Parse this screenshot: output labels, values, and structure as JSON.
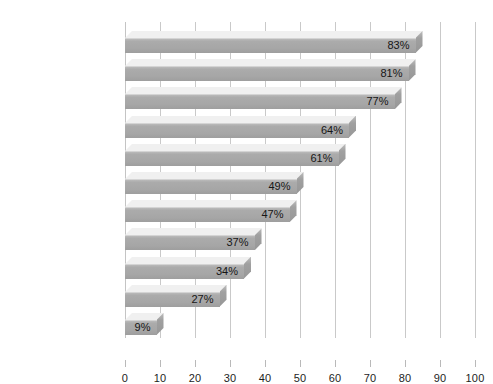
{
  "chart_data": {
    "type": "bar",
    "orientation": "horizontal",
    "title": "",
    "subtitle": "",
    "xlabel": "",
    "ylabel": "",
    "xlim": [
      0,
      100
    ],
    "xtick_step": 10,
    "grid": true,
    "legend": null,
    "value_suffix": "%",
    "categories": [
      "Television",
      "Stereo",
      "Computer",
      "Video game system",
      "DVD player",
      "CD burner",
      "Cell phone",
      "Auto",
      "In-line skates",
      "Digital camera",
      "Pager/beeper"
    ],
    "values": [
      83,
      81,
      77,
      64,
      61,
      49,
      47,
      37,
      34,
      27,
      9
    ],
    "value_labels": [
      "83%",
      "81%",
      "77%",
      "64%",
      "61%",
      "49%",
      "47%",
      "37%",
      "34%",
      "27%",
      "9%"
    ],
    "xticks": [
      0,
      10,
      20,
      30,
      40,
      50,
      60,
      70,
      80,
      90,
      100
    ],
    "xtick_labels": [
      "0",
      "10",
      "20",
      "30",
      "40",
      "50",
      "60",
      "70",
      "80",
      "90",
      "100"
    ],
    "colors": {
      "background": "#ffffff",
      "bar_front": "#a9a9a9",
      "bar_top": "#f0f0f0",
      "bar_cap": "#9a9a9a",
      "gridline": "#c9c9c9",
      "text": "#161616"
    }
  }
}
